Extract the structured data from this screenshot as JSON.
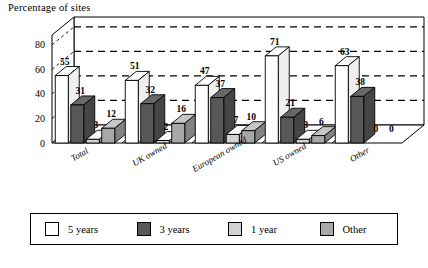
{
  "chart": {
    "title": "Percentage of sites",
    "footnote": ""
  },
  "chart_data": {
    "type": "bar",
    "title": "Percentage of sites",
    "xlabel": "",
    "ylabel": "Percentage of sites",
    "ylim": [
      0,
      80
    ],
    "yticks": [
      0,
      20,
      40,
      60,
      80
    ],
    "grid": true,
    "legend_position": "bottom",
    "categories": [
      "Total",
      "UK owned",
      "European owned",
      "US owned",
      "Other"
    ],
    "series": [
      {
        "name": "5 years",
        "color": "#ffffff",
        "values": [
          55,
          51,
          47,
          71,
          63
        ]
      },
      {
        "name": "3 years",
        "color": "#58585a",
        "values": [
          31,
          32,
          37,
          21,
          38
        ]
      },
      {
        "name": "1 year",
        "color": "#d2d2d2",
        "values": [
          3,
          2,
          7,
          3,
          0
        ]
      },
      {
        "name": "Other",
        "color": "#a8a8a8",
        "values": [
          12,
          16,
          10,
          6,
          0
        ]
      }
    ]
  },
  "legend": {
    "items": [
      {
        "label": "5 years",
        "color": "#ffffff"
      },
      {
        "label": "3 years",
        "color": "#58585a"
      },
      {
        "label": "1 year",
        "color": "#d2d2d2"
      },
      {
        "label": "Other",
        "color": "#a8a8a8"
      }
    ]
  },
  "axis": {
    "yticks": [
      "0",
      "20",
      "40",
      "60",
      "80"
    ]
  }
}
